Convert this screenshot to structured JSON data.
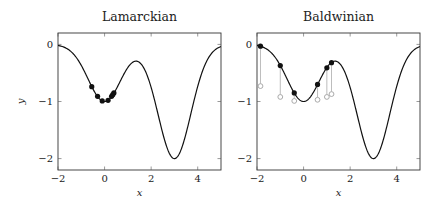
{
  "chart_data": [
    {
      "type": "line",
      "title": "Lamarckian",
      "xlabel": "x",
      "ylabel": "y",
      "xlim": [
        -2,
        5
      ],
      "ylim": [
        -2.2,
        0.2
      ],
      "xticks": [
        -2,
        0,
        2,
        4
      ],
      "yticks": [
        0,
        -1,
        -2
      ],
      "xtick_labels": [
        "−2",
        "0",
        "2",
        "4"
      ],
      "ytick_labels": [
        "0",
        "−1",
        "−2"
      ],
      "grid": false,
      "function": "y = -exp(-x^2) - 2*exp(-(x-3)^2)",
      "points": {
        "style": "filled",
        "x": [
          -0.55,
          -0.3,
          -0.1,
          0.15,
          0.3,
          0.35,
          0.4
        ],
        "y": [
          -0.74,
          -0.91,
          -0.99,
          -0.98,
          -0.91,
          -0.88,
          -0.85
        ]
      }
    },
    {
      "type": "line",
      "title": "Baldwinian",
      "xlabel": "x",
      "ylabel": "",
      "xlim": [
        -2,
        5
      ],
      "ylim": [
        -2.2,
        0.2
      ],
      "xticks": [
        -2,
        0,
        2,
        4
      ],
      "yticks": [
        0,
        -1,
        -2
      ],
      "xtick_labels": [
        "−2",
        "0",
        "2",
        "4"
      ],
      "ytick_labels": [
        "0",
        "−1",
        "−2"
      ],
      "grid": false,
      "function": "y = -exp(-x^2) - 2*exp(-(x-3)^2)",
      "points": {
        "style": "filled",
        "x": [
          -1.85,
          -1.0,
          -0.4,
          0.6,
          1.0,
          1.2
        ],
        "y": [
          -0.03,
          -0.37,
          -0.85,
          -0.7,
          -0.41,
          -0.32
        ]
      },
      "learned_points": {
        "style": "hollow",
        "x": [
          -1.85,
          -1.0,
          -0.4,
          0.6,
          1.0,
          1.2
        ],
        "y": [
          -0.73,
          -0.92,
          -0.99,
          -0.97,
          -0.92,
          -0.87
        ]
      }
    }
  ],
  "layout": {
    "panels": [
      {
        "x0": 58,
        "x1": 221,
        "y0": 33,
        "y1": 170
      },
      {
        "x0": 257,
        "x1": 420,
        "y0": 33,
        "y1": 170
      }
    ],
    "colors": {
      "curve": "#111111",
      "points": "#111111",
      "stems": "#b5b5b5",
      "hollow": "#a0a0a0"
    }
  }
}
